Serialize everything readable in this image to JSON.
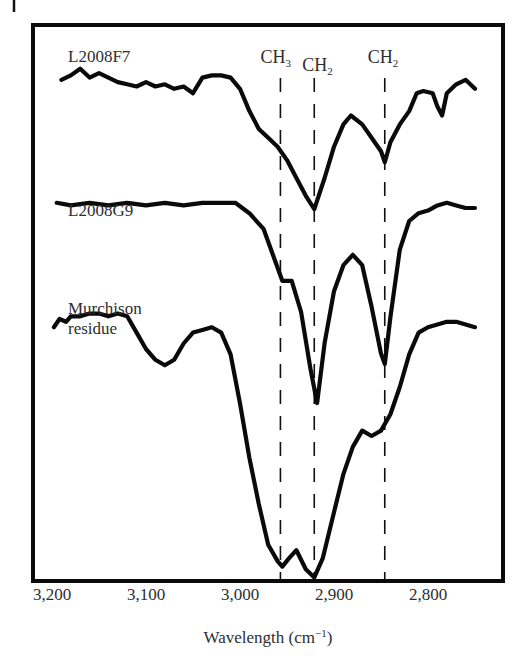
{
  "chart_data": {
    "type": "line",
    "title": "",
    "xlabel": "Wavelength (cm⁻¹)",
    "xlabel_main": "Wavelength (cm",
    "xlabel_sup": "−1",
    "xlabel_close": ")",
    "ylabel": "",
    "xlim": [
      3200,
      2750
    ],
    "x_reversed": true,
    "y_ticks_shown": false,
    "grid": false,
    "legend_position": "inline labels above each trace",
    "x_ticks": [
      3200,
      3100,
      3000,
      2900,
      2800
    ],
    "x_tick_labels": [
      "3,200",
      "3,100",
      "3,000",
      "2,900",
      "2,800"
    ],
    "band_markers": [
      {
        "label": "CH",
        "subscript": "3",
        "wavenumber": 2957
      },
      {
        "label": "CH",
        "subscript": "2",
        "wavenumber": 2921
      },
      {
        "label": "CH",
        "subscript": "2",
        "wavenumber": 2846
      }
    ],
    "series": [
      {
        "name": "L2008F7",
        "label_lines": [
          "L2008F7"
        ],
        "note": "relative transmittance, offset vertically; lower = stronger absorption",
        "x": [
          3190,
          3180,
          3170,
          3160,
          3150,
          3140,
          3130,
          3120,
          3110,
          3100,
          3090,
          3080,
          3070,
          3060,
          3050,
          3040,
          3030,
          3020,
          3010,
          3000,
          2990,
          2980,
          2970,
          2960,
          2950,
          2940,
          2930,
          2921,
          2910,
          2900,
          2890,
          2882,
          2870,
          2860,
          2850,
          2846,
          2840,
          2830,
          2820,
          2812,
          2805,
          2795,
          2790,
          2785,
          2780,
          2770,
          2760,
          2750
        ],
        "y": [
          0.92,
          0.94,
          0.97,
          0.93,
          0.95,
          0.93,
          0.91,
          0.9,
          0.89,
          0.91,
          0.89,
          0.9,
          0.88,
          0.89,
          0.86,
          0.93,
          0.94,
          0.94,
          0.93,
          0.88,
          0.78,
          0.7,
          0.66,
          0.62,
          0.56,
          0.48,
          0.4,
          0.34,
          0.48,
          0.62,
          0.72,
          0.76,
          0.72,
          0.66,
          0.6,
          0.55,
          0.64,
          0.72,
          0.78,
          0.86,
          0.87,
          0.86,
          0.8,
          0.76,
          0.86,
          0.9,
          0.92,
          0.88
        ]
      },
      {
        "name": "L2008G9",
        "label_lines": [
          "L2008G9"
        ],
        "x": [
          3195,
          3180,
          3160,
          3140,
          3120,
          3100,
          3080,
          3060,
          3040,
          3020,
          3005,
          2990,
          2975,
          2965,
          2955,
          2945,
          2935,
          2925,
          2918,
          2910,
          2900,
          2890,
          2880,
          2870,
          2860,
          2850,
          2846,
          2840,
          2830,
          2820,
          2810,
          2800,
          2790,
          2780,
          2770,
          2760,
          2750
        ],
        "y": [
          0.92,
          0.91,
          0.92,
          0.91,
          0.92,
          0.91,
          0.92,
          0.91,
          0.92,
          0.92,
          0.92,
          0.88,
          0.82,
          0.72,
          0.62,
          0.62,
          0.5,
          0.28,
          0.15,
          0.38,
          0.58,
          0.68,
          0.72,
          0.68,
          0.52,
          0.34,
          0.3,
          0.48,
          0.74,
          0.85,
          0.88,
          0.89,
          0.91,
          0.92,
          0.91,
          0.9,
          0.9
        ]
      },
      {
        "name": "Murchison residue",
        "label_lines": [
          "Murchison",
          "residue"
        ],
        "x": [
          3198,
          3192,
          3185,
          3180,
          3170,
          3160,
          3150,
          3140,
          3130,
          3120,
          3110,
          3100,
          3090,
          3080,
          3070,
          3060,
          3050,
          3040,
          3030,
          3020,
          3010,
          3000,
          2990,
          2980,
          2970,
          2960,
          2955,
          2948,
          2940,
          2930,
          2921,
          2912,
          2900,
          2890,
          2880,
          2870,
          2860,
          2850,
          2840,
          2830,
          2820,
          2810,
          2800,
          2790,
          2780,
          2770,
          2760,
          2750
        ],
        "y": [
          0.9,
          0.93,
          0.92,
          0.94,
          0.94,
          0.95,
          0.95,
          0.94,
          0.95,
          0.94,
          0.88,
          0.82,
          0.78,
          0.76,
          0.78,
          0.84,
          0.88,
          0.89,
          0.9,
          0.88,
          0.8,
          0.62,
          0.42,
          0.25,
          0.1,
          0.04,
          0.02,
          0.05,
          0.08,
          0.01,
          -0.02,
          0.05,
          0.22,
          0.36,
          0.46,
          0.52,
          0.5,
          0.52,
          0.58,
          0.68,
          0.8,
          0.88,
          0.9,
          0.91,
          0.92,
          0.92,
          0.91,
          0.9
        ]
      }
    ]
  },
  "figure": {
    "frame": {
      "left": 33,
      "top": 25,
      "right": 503,
      "bottom": 581
    },
    "x_px_per_unit": 0.94,
    "x_px_at_3200": 52,
    "label_color": "#2e2e2e",
    "trace_color": "#0a0a0a"
  }
}
